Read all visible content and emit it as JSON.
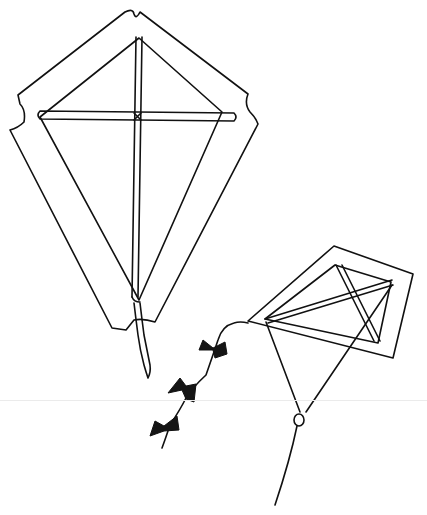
{
  "image": {
    "description": "Hand-drawn black ink line sketch of two diamond-shaped kites on white background",
    "background_color": "#ffffff",
    "ink_color": "#111111"
  },
  "kites": [
    {
      "name": "large-kite",
      "position": "upper-left",
      "features": [
        "outer border panel",
        "vertical spine",
        "horizontal cross spar",
        "tail ribbon"
      ]
    },
    {
      "name": "small-kite",
      "position": "lower-right",
      "features": [
        "tilted diamond frame",
        "double spars",
        "bridle lines",
        "ring",
        "flying line",
        "bow-tie tail"
      ]
    }
  ],
  "tail_bows": 3
}
